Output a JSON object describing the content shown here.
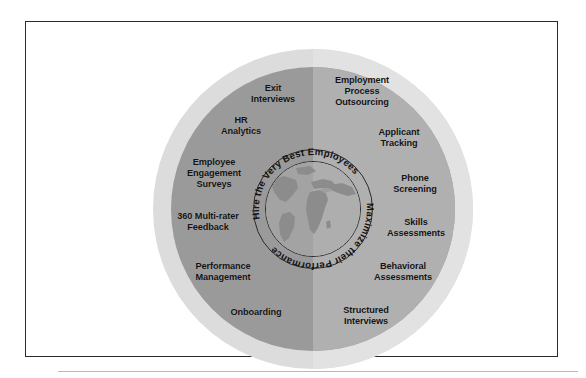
{
  "figure": {
    "colors": {
      "halo_left": "#dcdcdc",
      "halo_right": "#e2e2e2",
      "body_left": "#9a9a9a",
      "body_right": "#b0b0b0",
      "globe_ocean": "#a8a8a8",
      "globe_land": "#8e8e8e",
      "outline": "#2b2b2b",
      "text": "#131313",
      "frame_border": "#2a2a2a",
      "page_background": "#ffffff"
    }
  },
  "core": {
    "globe_icon": "globe-icon",
    "arc_left_text": "Maximize their Performance",
    "arc_right_text": "Hire the Very Best Employees"
  },
  "halves": {
    "left": {
      "name": "Maximize their Performance",
      "labels": [
        "Exit\nInterviews",
        "HR\nAnalytics",
        "Employee\nEngagement\nSurveys",
        "360 Multi-rater\nFeedback",
        "Performance\nManagement",
        "Onboarding"
      ]
    },
    "right": {
      "name": "Hire the Very Best Employees",
      "labels": [
        "Employment\nProcess\nOutsourcing",
        "Applicant\nTracking",
        "Phone\nScreening",
        "Skills\nAssessments",
        "Behavioral\nAssessments",
        "Structured\nInterviews"
      ]
    }
  }
}
